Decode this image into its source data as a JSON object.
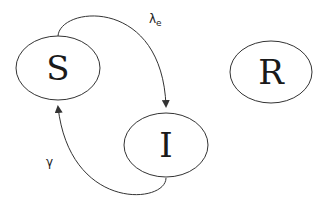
{
  "diagram": {
    "type": "compartmental-model",
    "nodes": [
      {
        "id": "S",
        "label": "S",
        "cx": 58,
        "cy": 68,
        "rx": 42,
        "ry": 32
      },
      {
        "id": "I",
        "label": "I",
        "cx": 166,
        "cy": 145,
        "rx": 42,
        "ry": 32
      },
      {
        "id": "R",
        "label": "R",
        "cx": 271,
        "cy": 72,
        "rx": 41,
        "ry": 31
      }
    ],
    "edges": [
      {
        "from": "S",
        "to": "I",
        "label": "λ",
        "label_subscript": "e"
      },
      {
        "from": "I",
        "to": "S",
        "label": "γ"
      }
    ],
    "colors": {
      "stroke": "#333333",
      "text": "#1a1a1a",
      "background": "#ffffff"
    }
  }
}
